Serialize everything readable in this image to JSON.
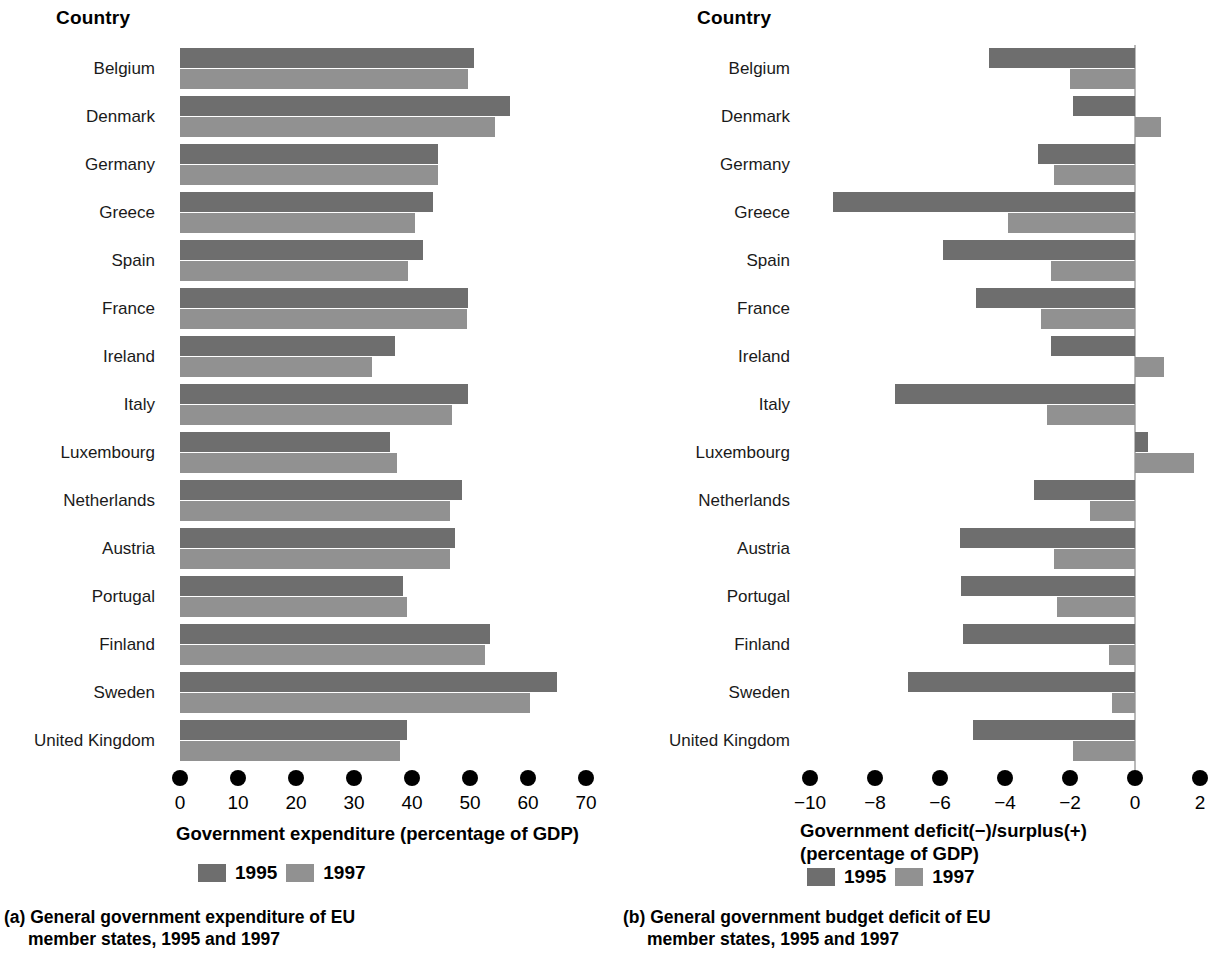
{
  "colors": {
    "bar_1995": "#6e6e6e",
    "bar_1997": "#919191",
    "zero_line": "#b9b9b9",
    "text": "#000000",
    "background": "#ffffff"
  },
  "panel_a": {
    "column_header": "Country",
    "caption_line1": "(a) General government expenditure of EU",
    "caption_line2": "member states, 1995 and 1997",
    "legend": [
      {
        "label": "1995",
        "color": "#6e6e6e"
      },
      {
        "label": "1997",
        "color": "#919191"
      }
    ]
  },
  "panel_b": {
    "column_header": "Country",
    "caption_line1": "(b) General government budget deficit of EU",
    "caption_line2": "member states, 1995 and 1997",
    "legend": [
      {
        "label": "1995",
        "color": "#6e6e6e"
      },
      {
        "label": "1997",
        "color": "#919191"
      }
    ]
  },
  "chart_data": [
    {
      "id": "expenditure",
      "type": "bar",
      "orientation": "horizontal",
      "title": "(a) General government expenditure of EU member states, 1995 and 1997",
      "xlabel": "Government expenditure (percentage of GDP)",
      "ylabel": "Country",
      "xlim": [
        0,
        70
      ],
      "xticks": [
        0,
        10,
        20,
        30,
        40,
        50,
        60,
        70
      ],
      "xticklabels": [
        "0",
        "10",
        "20",
        "30",
        "40",
        "50",
        "60",
        "70"
      ],
      "grid": false,
      "legend_position": "below-axis",
      "categories": [
        "Belgium",
        "Denmark",
        "Germany",
        "Greece",
        "Spain",
        "France",
        "Ireland",
        "Italy",
        "Luxembourg",
        "Netherlands",
        "Austria",
        "Portugal",
        "Finland",
        "Sweden",
        "United Kingdom"
      ],
      "series": [
        {
          "name": "1995",
          "color": "#6e6e6e",
          "values": [
            50.7,
            56.9,
            44.5,
            43.6,
            41.9,
            49.7,
            37.1,
            49.7,
            36.2,
            48.6,
            47.4,
            38.4,
            53.4,
            65.0,
            39.1
          ]
        },
        {
          "name": "1997",
          "color": "#919191",
          "values": [
            49.7,
            54.3,
            44.5,
            40.5,
            39.3,
            49.5,
            33.1,
            46.9,
            37.4,
            46.6,
            46.6,
            39.1,
            52.6,
            60.3,
            37.9
          ]
        }
      ]
    },
    {
      "id": "deficit",
      "type": "bar",
      "orientation": "horizontal",
      "title": "(b) General government budget deficit of EU member states, 1995 and 1997",
      "xlabel": "Government deficit(−)/surplus(+)\n(percentage of GDP)",
      "ylabel": "Country",
      "xlim": [
        -10,
        2
      ],
      "xticks": [
        -10,
        -8,
        -6,
        -4,
        -2,
        0,
        2
      ],
      "xticklabels": [
        "−10",
        "−8",
        "−6",
        "−4",
        "−2",
        "0",
        "2"
      ],
      "grid": false,
      "zero_line": true,
      "legend_position": "below-axis",
      "categories": [
        "Belgium",
        "Denmark",
        "Germany",
        "Greece",
        "Spain",
        "France",
        "Ireland",
        "Italy",
        "Luxembourg",
        "Netherlands",
        "Austria",
        "Portugal",
        "Finland",
        "Sweden",
        "United Kingdom"
      ],
      "series": [
        {
          "name": "1995",
          "color": "#6e6e6e",
          "values": [
            -4.5,
            -1.9,
            -3.0,
            -9.3,
            -5.9,
            -4.9,
            -2.6,
            -7.4,
            0.4,
            -3.1,
            -5.4,
            -5.35,
            -5.3,
            -7.0,
            -5.0
          ]
        },
        {
          "name": "1997",
          "color": "#919191",
          "values": [
            -2.0,
            0.8,
            -2.5,
            -3.9,
            -2.6,
            -2.9,
            0.9,
            -2.7,
            1.8,
            -1.4,
            -2.5,
            -2.4,
            -0.8,
            -0.7,
            -1.9
          ]
        }
      ]
    }
  ]
}
